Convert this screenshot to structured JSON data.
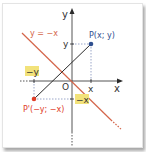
{
  "diagram": {
    "colors": {
      "axis": "#2a2a2a",
      "line": "#d4654a",
      "point_p": "#2f4f8f",
      "point_p_prime": "#e0402a",
      "highlight": "#f2e27a",
      "guide": "#9aa6c8",
      "text_dark": "#333333"
    },
    "axes": {
      "x_label": "x",
      "y_label": "y",
      "origin_label": "O"
    },
    "line_label": "y = −x",
    "point_p": {
      "label": "P(x; y)",
      "x_tick": "x",
      "y_tick": "y"
    },
    "point_p_prime": {
      "label": "P'(−y; −x)",
      "x_tick": "−x",
      "y_tick": "−y"
    }
  }
}
